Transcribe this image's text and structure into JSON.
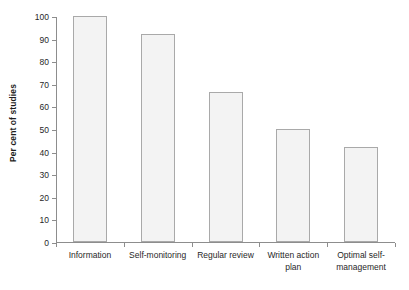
{
  "chart_data": {
    "type": "bar",
    "title": "",
    "subtitle": "",
    "xlabel": "",
    "ylabel": "Per cent of studies",
    "categories": [
      "Information",
      "Self-monitoring",
      "Regular review",
      "Written action plan",
      "Optimal self-management"
    ],
    "values": [
      100,
      92,
      66.5,
      50,
      42
    ],
    "ylim": [
      0,
      100
    ],
    "ytick_labels": [
      "0",
      "10",
      "20",
      "30",
      "40",
      "50",
      "60",
      "70",
      "80",
      "90",
      "100"
    ],
    "ytick_values": [
      0,
      10,
      20,
      30,
      40,
      50,
      60,
      70,
      80,
      90,
      100
    ],
    "grid": false,
    "legend": null,
    "bar_fill_color": "#f3f3f3",
    "bar_border_color": "#a9a9a9",
    "axis_color": "#8d8d8d"
  }
}
